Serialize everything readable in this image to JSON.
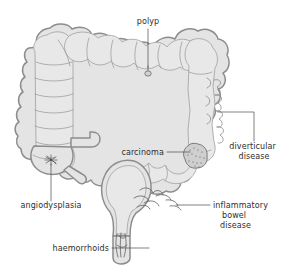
{
  "figure": {
    "background_color": "#ffffff",
    "wall_fill_color": "#e4e4e4",
    "wall_stroke_color": "#8d8d8d",
    "label_color": "#2e2e2e",
    "leader_color": "#4a4a4a"
  },
  "labels": [
    {
      "id": "polyp",
      "text": "polyp",
      "lines": [
        "polyp"
      ],
      "anchor": "middle",
      "x": 148,
      "y": 24,
      "target": "transverse-colon"
    },
    {
      "id": "diverticular-disease",
      "text": "diverticular disease",
      "lines": [
        "diverticular",
        "disease"
      ],
      "anchor": "middle",
      "x": 254,
      "y": 149,
      "target": "descending-colon"
    },
    {
      "id": "carcinoma",
      "text": "carcinoma",
      "lines": [
        "carcinoma"
      ],
      "anchor": "end",
      "x": 164,
      "y": 155,
      "target": "sigmoid-colon"
    },
    {
      "id": "inflammatory-bowel-disease",
      "text": "inflammatory bowel disease",
      "lines": [
        "inflammatory",
        "bowel",
        "disease"
      ],
      "anchor": "middle",
      "x": 253,
      "y": 208,
      "target": "rectosigmoid"
    },
    {
      "id": "angiodysplasia",
      "text": "angiodysplasia",
      "lines": [
        "angiodysplasia"
      ],
      "anchor": "middle",
      "x": 57,
      "y": 208,
      "target": "caecum"
    },
    {
      "id": "haemorrhoids",
      "text": "haemorrhoids",
      "lines": [
        "haemorrhoids"
      ],
      "anchor": "end",
      "x": 108,
      "y": 251,
      "target": "anal-canal"
    }
  ],
  "anatomy": [
    {
      "id": "caecum",
      "name": "caecum"
    },
    {
      "id": "ascending-colon",
      "name": "ascending colon"
    },
    {
      "id": "transverse-colon",
      "name": "transverse colon"
    },
    {
      "id": "descending-colon",
      "name": "descending colon"
    },
    {
      "id": "sigmoid-colon",
      "name": "sigmoid colon"
    },
    {
      "id": "rectum",
      "name": "rectum"
    },
    {
      "id": "anal-canal",
      "name": "anal canal"
    },
    {
      "id": "appendix",
      "name": "appendix"
    },
    {
      "id": "terminal-ileum",
      "name": "terminal ileum"
    }
  ]
}
